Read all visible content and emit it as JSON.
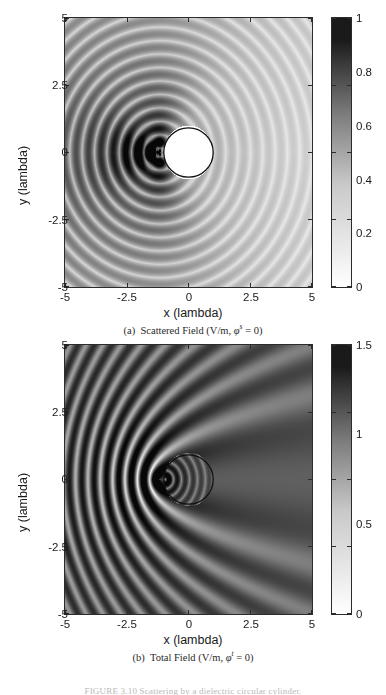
{
  "figure": {
    "caption_partial": "FIGURE 3.10 Scattering by a dielectric circular cylinder."
  },
  "panels": [
    {
      "id": "a",
      "subcaption": {
        "tag": "(a)",
        "text": "Scattered Field (V/m, ",
        "symbol": "φ",
        "sup": "s",
        "tail": " = 0)"
      },
      "axes": {
        "xlabel": "x (lambda)",
        "ylabel": "y (lambda)",
        "xticks": [
          "-5",
          "-2.5",
          "0",
          "2.5",
          "5"
        ],
        "yticks": [
          "5",
          "2.5",
          "0",
          "-2.5",
          "-5"
        ],
        "xlim": [
          -5,
          5
        ],
        "ylim": [
          -5,
          5
        ]
      },
      "colorbar": {
        "ticks": [
          "1",
          "0.8",
          "0.6",
          "0.4",
          "0.2",
          "0"
        ],
        "min": 0,
        "max": 1,
        "low_color": "#ffffff",
        "high_color": "#1a1a1a"
      }
    },
    {
      "id": "b",
      "subcaption": {
        "tag": "(b)",
        "text": "Total Field (V/m, ",
        "symbol": "φ",
        "sup": "t",
        "tail": " = 0)"
      },
      "axes": {
        "xlabel": "x (lambda)",
        "ylabel": "y (lambda)",
        "xticks": [
          "-5",
          "-2.5",
          "0",
          "2.5",
          "5"
        ],
        "yticks": [
          "5",
          "2.5",
          "0",
          "-2.5",
          "-5"
        ],
        "xlim": [
          -5,
          5
        ],
        "ylim": [
          -5,
          5
        ]
      },
      "colorbar": {
        "ticks": [
          "1.5",
          "1",
          "0.5",
          "0"
        ],
        "min": 0,
        "max": 1.5,
        "low_color": "#ffffff",
        "high_color": "#1a1a1a"
      }
    }
  ],
  "chart_data": [
    {
      "type": "heatmap",
      "title": "(a) Scattered Field (V/m, phi^s = 0)",
      "xlabel": "x (lambda)",
      "ylabel": "y (lambda)",
      "xlim": [
        -5,
        5
      ],
      "ylim": [
        -5,
        5
      ],
      "xticks": [
        -5,
        -2.5,
        0,
        2.5,
        5
      ],
      "yticks": [
        -5,
        -2.5,
        0,
        2.5,
        5
      ],
      "zlim": [
        0,
        1
      ],
      "zticks": [
        0,
        0.2,
        0.4,
        0.6,
        0.8,
        1
      ],
      "colormap": "gray_reversed",
      "grid": false,
      "legend": "colorbar-right",
      "field_model": {
        "description": "Magnitude of scattered field of a plane wave incident from -x on a circular dielectric cylinder; concentric ring interference lobes centered near the illuminated (left) face of the cylinder, strongest backscatter toward -x.",
        "wavenumber_per_lambda": 6.2831853,
        "source_center": [
          -1.15,
          0.0
        ],
        "forward_shadow_axis_deg": 0,
        "rings_visible": 13,
        "peak_value": 1.0,
        "background_value": 0.2
      },
      "scatterer": {
        "shape": "circle",
        "center": [
          0,
          0
        ],
        "radius": 1.0,
        "fill": "white",
        "edge": "#111111",
        "masked": true
      }
    },
    {
      "type": "heatmap",
      "title": "(b) Total Field (V/m, phi^t = 0)",
      "xlabel": "x (lambda)",
      "ylabel": "y (lambda)",
      "xlim": [
        -5,
        5
      ],
      "ylim": [
        -5,
        5
      ],
      "xticks": [
        -5,
        -2.5,
        0,
        2.5,
        5
      ],
      "yticks": [
        -5,
        -2.5,
        0,
        2.5,
        5
      ],
      "zlim": [
        0,
        1.5
      ],
      "zticks": [
        0,
        0.5,
        1,
        1.5
      ],
      "colormap": "gray_reversed",
      "grid": false,
      "legend": "colorbar-right",
      "field_model": {
        "description": "Magnitude of total field: vertical plane-wave standing-wave stripes (propagating along +x) interfering with the cylinder's scattered field; bright focus spot just left of the cylinder and wake lobes in the upper-left and lower-left quadrants.",
        "wavenumber_per_lambda": 6.2831853,
        "plane_wave_direction_deg": 0,
        "stripe_period_lambda": 0.5,
        "hotspot_center": [
          -1.2,
          0.0
        ],
        "peak_value": 1.5,
        "mean_value": 0.8
      },
      "scatterer": {
        "shape": "circle",
        "center": [
          0,
          0
        ],
        "radius": 1.0,
        "fill": "transparent",
        "edge": "#111111",
        "masked": false
      }
    }
  ]
}
